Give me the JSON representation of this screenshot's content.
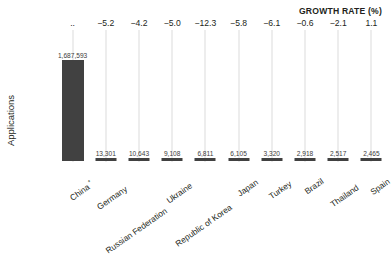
{
  "header": {
    "growth_rate_title": "GROWTH RATE (%)"
  },
  "axes": {
    "y_label": "Applications"
  },
  "chart_data": {
    "type": "bar",
    "title": "",
    "xlabel": "",
    "ylabel": "Applications",
    "grid": true,
    "legend": null,
    "ylim": [
      0,
      1687593
    ],
    "categories": [
      "China *",
      "Germany",
      "Russian Federation",
      "Ukraine",
      "Republic of Korea",
      "Japan",
      "Turkey",
      "Brazil",
      "Thailand",
      "Spain"
    ],
    "category_labels_plain": [
      "China",
      "Germany",
      "Russian Federation",
      "Ukraine",
      "Republic of Korea",
      "Japan",
      "Turkey",
      "Brazil",
      "Thailand",
      "Spain"
    ],
    "category_footnote_marks": [
      "*",
      "",
      "",
      "",
      "",
      "",
      "",
      "",
      "",
      ""
    ],
    "values": [
      1687593,
      13301,
      10643,
      9108,
      6811,
      6105,
      3320,
      2918,
      2517,
      2465
    ],
    "value_labels": [
      "1,687,593",
      "13,301",
      "10,643",
      "9,108",
      "6,811",
      "6,105",
      "3,320",
      "2,918",
      "2,517",
      "2,465"
    ],
    "series": [
      {
        "name": "Applications",
        "values": [
          1687593,
          13301,
          10643,
          9108,
          6811,
          6105,
          3320,
          2918,
          2517,
          2465
        ],
        "color": "#414141"
      }
    ],
    "secondary_axis": {
      "name": "GROWTH RATE (%)",
      "labels": [
        "..",
        "−5.2",
        "−4.2",
        "−5.0",
        "−12.3",
        "−5.8",
        "−6.1",
        "−0.6",
        "−2.1",
        "1.1"
      ],
      "values": [
        null,
        -5.2,
        -4.2,
        -5.0,
        -12.3,
        -5.8,
        -6.1,
        -0.6,
        -2.1,
        1.1
      ]
    }
  },
  "colors": {
    "bar": "#414141",
    "gridline": "#dcdcdc",
    "text": "#231f20",
    "value_text": "#3d3d3d",
    "background": "#ffffff"
  }
}
